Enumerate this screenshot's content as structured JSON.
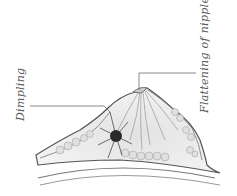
{
  "figure": {
    "labels": [
      {
        "id": "dimpling",
        "text": "Dimpling"
      },
      {
        "id": "flattening",
        "text": "Flattening of nipple"
      }
    ]
  },
  "colors": {
    "line": "#6a6a6a",
    "outline": "#555555",
    "fill": "#ececec",
    "tissue": "#d6d6d6",
    "tumour": "#2a2a2a",
    "text": "#555555"
  }
}
